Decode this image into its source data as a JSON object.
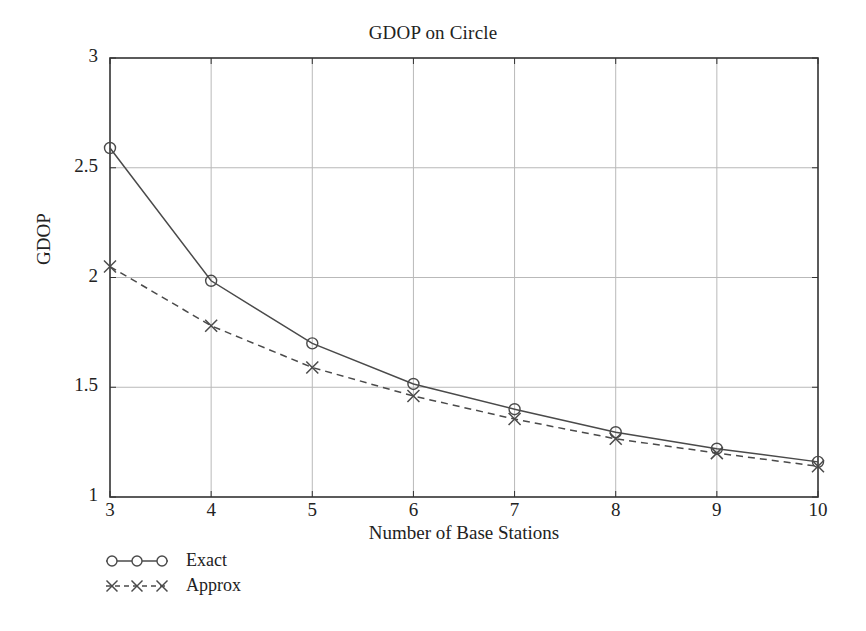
{
  "chart_data": {
    "type": "line",
    "title": "GDOP on Circle",
    "xlabel": "Number of Base Stations",
    "ylabel": "GDOP",
    "x": [
      3,
      4,
      5,
      6,
      7,
      8,
      9,
      10
    ],
    "xlim": [
      3,
      10
    ],
    "ylim": [
      1,
      3
    ],
    "xticks": [
      "3",
      "4",
      "5",
      "6",
      "7",
      "8",
      "9",
      "10"
    ],
    "yticks": [
      "1",
      "1.5",
      "2",
      "2.5",
      "3"
    ],
    "grid": true,
    "legend_position": "below-left",
    "series": [
      {
        "name": "Exact",
        "marker": "circle",
        "linestyle": "solid",
        "color": "#4a4a4a",
        "values": [
          2.59,
          1.985,
          1.7,
          1.515,
          1.4,
          1.295,
          1.22,
          1.16
        ]
      },
      {
        "name": "Approx",
        "marker": "x",
        "linestyle": "dashed",
        "color": "#4a4a4a",
        "values": [
          2.05,
          1.78,
          1.59,
          1.46,
          1.355,
          1.265,
          1.2,
          1.14
        ]
      }
    ]
  },
  "legend": {
    "entries": [
      {
        "label": "Exact"
      },
      {
        "label": "Approx"
      }
    ]
  },
  "style": {
    "axis_color": "#333333",
    "grid_color": "#b9b9b9",
    "line_color": "#4a4a4a",
    "text_color": "#222222",
    "background": "#ffffff"
  }
}
